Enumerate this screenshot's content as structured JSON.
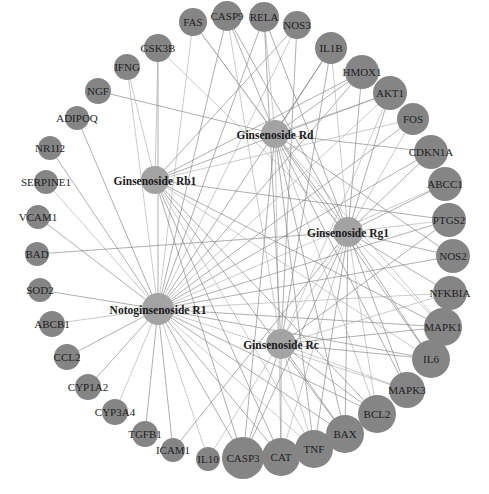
{
  "figure": {
    "type": "compound-target network",
    "top_caption": "",
    "bottom_caption": ""
  },
  "colors": {
    "target_node": "#858585",
    "compound_node": "#a3a3a3",
    "edge": "#7a7a7a",
    "background": "#ffffff"
  },
  "compounds": [
    {
      "id": "Rd",
      "label": "Ginsenoside Rd",
      "x": 275,
      "y": 134,
      "r": 14
    },
    {
      "id": "Rb1",
      "label": "Ginsenoside Rb1",
      "x": 155,
      "y": 180,
      "r": 14
    },
    {
      "id": "Rg1",
      "label": "Ginsenoside Rg1",
      "x": 348,
      "y": 232,
      "r": 15
    },
    {
      "id": "R1",
      "label": "Notoginsenoside R1",
      "x": 158,
      "y": 309,
      "r": 16
    },
    {
      "id": "Rc",
      "label": "Ginsenoside Rc",
      "x": 281,
      "y": 344,
      "r": 15
    }
  ],
  "targets": [
    {
      "label": "FAS",
      "x": 193,
      "y": 22,
      "r": 14
    },
    {
      "label": "CASP9",
      "x": 227,
      "y": 16,
      "r": 15
    },
    {
      "label": "RELA",
      "x": 264,
      "y": 17,
      "r": 15
    },
    {
      "label": "NOS3",
      "x": 297,
      "y": 25,
      "r": 14
    },
    {
      "label": "IL1B",
      "x": 331,
      "y": 48,
      "r": 16
    },
    {
      "label": "HMOX1",
      "x": 362,
      "y": 72,
      "r": 17
    },
    {
      "label": "AKT1",
      "x": 390,
      "y": 93,
      "r": 17
    },
    {
      "label": "FOS",
      "x": 413,
      "y": 119,
      "r": 16
    },
    {
      "label": "CDKN1A",
      "x": 431,
      "y": 152,
      "r": 17
    },
    {
      "label": "ABCC1",
      "x": 445,
      "y": 184,
      "r": 17
    },
    {
      "label": "PTGS2",
      "x": 449,
      "y": 220,
      "r": 17
    },
    {
      "label": "NOS2",
      "x": 453,
      "y": 256,
      "r": 17
    },
    {
      "label": "NFKBIA",
      "x": 450,
      "y": 293,
      "r": 17
    },
    {
      "label": "MAPK1",
      "x": 443,
      "y": 327,
      "r": 19
    },
    {
      "label": "IL6",
      "x": 431,
      "y": 359,
      "r": 19
    },
    {
      "label": "MAPK3",
      "x": 407,
      "y": 390,
      "r": 18
    },
    {
      "label": "BCL2",
      "x": 377,
      "y": 414,
      "r": 19
    },
    {
      "label": "BAX",
      "x": 345,
      "y": 434,
      "r": 19
    },
    {
      "label": "TNF",
      "x": 314,
      "y": 449,
      "r": 19
    },
    {
      "label": "CAT",
      "x": 281,
      "y": 457,
      "r": 19
    },
    {
      "label": "CASP3",
      "x": 243,
      "y": 458,
      "r": 21
    },
    {
      "label": "IL10",
      "x": 208,
      "y": 459,
      "r": 12
    },
    {
      "label": "ICAM1",
      "x": 173,
      "y": 450,
      "r": 12
    },
    {
      "label": "TGFB1",
      "x": 145,
      "y": 434,
      "r": 13
    },
    {
      "label": "CYP3A4",
      "x": 115,
      "y": 412,
      "r": 13
    },
    {
      "label": "CYP1A2",
      "x": 88,
      "y": 387,
      "r": 13
    },
    {
      "label": "CCL2",
      "x": 67,
      "y": 357,
      "r": 13
    },
    {
      "label": "ABCB1",
      "x": 52,
      "y": 324,
      "r": 13
    },
    {
      "label": "SOD2",
      "x": 40,
      "y": 290,
      "r": 12
    },
    {
      "label": "BAD",
      "x": 37,
      "y": 254,
      "r": 12
    },
    {
      "label": "VCAM1",
      "x": 38,
      "y": 217,
      "r": 12
    },
    {
      "label": "SERPINE1",
      "x": 46,
      "y": 182,
      "r": 12
    },
    {
      "label": "NR1I2",
      "x": 50,
      "y": 148,
      "r": 12
    },
    {
      "label": "ADIPOQ",
      "x": 77,
      "y": 118,
      "r": 12
    },
    {
      "label": "NGF",
      "x": 98,
      "y": 91,
      "r": 13
    },
    {
      "label": "IFNG",
      "x": 127,
      "y": 67,
      "r": 13
    },
    {
      "label": "GSK3B",
      "x": 158,
      "y": 48,
      "r": 14
    }
  ],
  "edges": {
    "R1": [
      "FAS",
      "CASP9",
      "RELA",
      "NOS3",
      "IL1B",
      "HMOX1",
      "AKT1",
      "FOS",
      "CDKN1A",
      "ABCC1",
      "PTGS2",
      "NOS2",
      "NFKBIA",
      "MAPK1",
      "IL6",
      "MAPK3",
      "BCL2",
      "BAX",
      "TNF",
      "CAT",
      "CASP3",
      "IL10",
      "ICAM1",
      "TGFB1",
      "CYP3A4",
      "CYP1A2",
      "CCL2",
      "ABCB1",
      "SOD2",
      "NR1I2",
      "SERPINE1",
      "VCAM1",
      "ADIPOQ",
      "IFNG",
      "GSK3B"
    ],
    "Rg1": [
      "CASP9",
      "RELA",
      "IL1B",
      "HMOX1",
      "AKT1",
      "FOS",
      "CDKN1A",
      "ABCC1",
      "PTGS2",
      "NOS2",
      "NFKBIA",
      "MAPK1",
      "IL6",
      "MAPK3",
      "BCL2",
      "BAX",
      "TNF",
      "CAT",
      "CASP3",
      "BAD",
      "GSK3B",
      "FAS",
      "ICAM1",
      "IL10"
    ],
    "Rd": [
      "NGF",
      "RELA",
      "IL1B",
      "HMOX1",
      "AKT1",
      "CDKN1A",
      "NOS2",
      "MAPK1",
      "IL6",
      "MAPK3",
      "BCL2",
      "BAX",
      "TNF",
      "CAT",
      "CASP3",
      "CASP9",
      "FAS"
    ],
    "Rb1": [
      "IFNG",
      "HMOX1",
      "AKT1",
      "FOS",
      "PTGS2",
      "MAPK1",
      "IL6",
      "BCL2",
      "BAX",
      "TNF",
      "CAT",
      "CASP3",
      "GSK3B",
      "NOS3"
    ],
    "Rc": [
      "NOS3",
      "IL1B",
      "AKT1",
      "MAPK1",
      "IL6",
      "MAPK3",
      "BCL2",
      "BAX",
      "TNF",
      "CAT",
      "CASP3",
      "NFKBIA",
      "PTGS2",
      "RELA",
      "CASP9"
    ]
  }
}
